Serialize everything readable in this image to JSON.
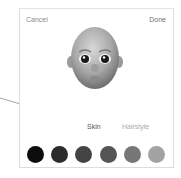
{
  "header": {
    "cancel_label": "Cancel",
    "done_label": "Done"
  },
  "avatar": {
    "icon": "memoji-bald-head"
  },
  "tabs": [
    {
      "label": "Skin",
      "selected": true
    },
    {
      "label": "Hairstyle",
      "selected": false
    }
  ],
  "swatches": [
    {
      "color": "#0d0d0d"
    },
    {
      "color": "#2c2c2c"
    },
    {
      "color": "#444444"
    },
    {
      "color": "#555555"
    },
    {
      "color": "#777777"
    },
    {
      "color": "#a3a3a3"
    }
  ],
  "annotation": {
    "type": "arrow",
    "points_to": "Skin",
    "color": "#9a9a9a"
  }
}
